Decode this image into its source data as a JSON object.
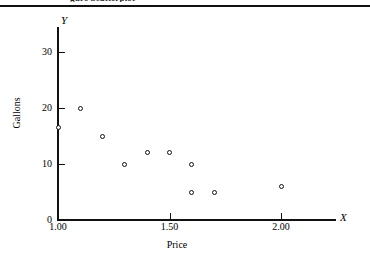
{
  "caption": {
    "clipped_text": "gure    Scatterplot"
  },
  "chart_data": {
    "type": "scatter",
    "title": "",
    "xlabel": "Price",
    "ylabel": "Gallons",
    "x_axis_symbol": "X",
    "y_axis_symbol": "Y",
    "xlim": [
      1.0,
      2.25
    ],
    "ylim": [
      0,
      32
    ],
    "xticks": [
      1.0,
      1.5,
      2.0
    ],
    "xtick_labels": [
      "1.00",
      "1.50",
      "2.00"
    ],
    "yticks": [
      0,
      10,
      20,
      30
    ],
    "ytick_labels": [
      "0",
      "10",
      "20",
      "30"
    ],
    "grid": false,
    "legend": false,
    "marker": "open-circle",
    "points": [
      {
        "x": 1.0,
        "y": 16.5
      },
      {
        "x": 1.1,
        "y": 20
      },
      {
        "x": 1.2,
        "y": 15
      },
      {
        "x": 1.3,
        "y": 10
      },
      {
        "x": 1.4,
        "y": 12
      },
      {
        "x": 1.5,
        "y": 12
      },
      {
        "x": 1.6,
        "y": 10
      },
      {
        "x": 1.6,
        "y": 5
      },
      {
        "x": 1.7,
        "y": 5
      },
      {
        "x": 2.0,
        "y": 6
      }
    ]
  }
}
